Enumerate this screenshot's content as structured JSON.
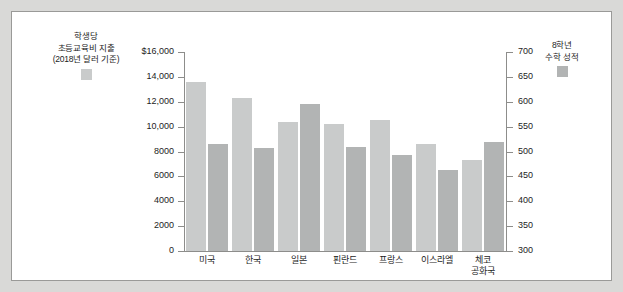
{
  "figure": {
    "background": "#ffffff",
    "outer_background": "#d9d9d7",
    "border_color": "#9a9a98"
  },
  "legend_spending": {
    "line1": "학생당",
    "line2": "초등교육비 지출",
    "line3": "(2018년 달러 기준)",
    "swatch_color": "#c9cbcb"
  },
  "legend_score": {
    "line1": "8학년",
    "line2": "수학 성적",
    "swatch_color": "#b2b4b4"
  },
  "chart_data": {
    "type": "bar",
    "title": "",
    "xlabel": "",
    "categories": [
      "미국",
      "한국",
      "일본",
      "핀란드",
      "프랑스",
      "이스라엘",
      "체코 공화국"
    ],
    "category_lines": [
      [
        "미국"
      ],
      [
        "한국"
      ],
      [
        "일본"
      ],
      [
        "핀란드"
      ],
      [
        "프랑스"
      ],
      [
        "이스라엘"
      ],
      [
        "체코",
        "공화국"
      ]
    ],
    "series": [
      {
        "name": "학생당 초등교육비 지출 (2018년 달러 기준)",
        "axis": "left",
        "color": "#c9cbcb",
        "values": [
          13600,
          12300,
          10400,
          10200,
          10500,
          8600,
          7300
        ]
      },
      {
        "name": "8학년 수학 성적",
        "axis": "right",
        "color": "#b2b4b4",
        "values": [
          515,
          507,
          595,
          509,
          493,
          463,
          520
        ]
      }
    ],
    "left_axis": {
      "label": "",
      "ylim": [
        0,
        16000
      ],
      "ticks": [
        0,
        2000,
        4000,
        6000,
        8000,
        10000,
        12000,
        14000,
        16000
      ],
      "tick_labels": [
        "0",
        "2000",
        "4000",
        "6000",
        "8000",
        "10,000",
        "12,000",
        "14,000",
        "$16,000"
      ]
    },
    "right_axis": {
      "label": "",
      "ylim": [
        300,
        700
      ],
      "ticks": [
        300,
        350,
        400,
        450,
        500,
        550,
        600,
        650,
        700
      ],
      "tick_labels": [
        "300",
        "350",
        "400",
        "450",
        "500",
        "550",
        "600",
        "650",
        "700"
      ]
    },
    "grid": false,
    "legend_position": "outside-top-left-and-top-right"
  }
}
